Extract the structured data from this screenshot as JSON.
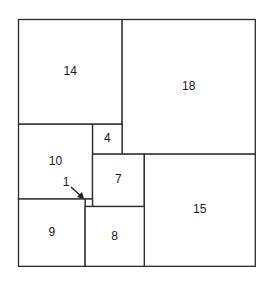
{
  "diagram": {
    "units": {
      "width": 32,
      "height": 33
    },
    "origin_px": {
      "x": 18.5,
      "y": 19.5
    },
    "scale_px": {
      "x": 7.4,
      "y": 7.48
    },
    "line_color": "#2a2a2a",
    "squares": [
      {
        "label": "14",
        "x": 0,
        "y": 0,
        "size": 14
      },
      {
        "label": "18",
        "x": 14,
        "y": 0,
        "size": 18
      },
      {
        "label": "4",
        "x": 10,
        "y": 14,
        "size": 4
      },
      {
        "label": "10",
        "x": 0,
        "y": 14,
        "size": 10
      },
      {
        "label": "7",
        "x": 10,
        "y": 18,
        "size": 7
      },
      {
        "label": "15",
        "x": 17,
        "y": 18,
        "size": 15
      },
      {
        "label": "1",
        "x": 9,
        "y": 24,
        "size": 1,
        "callout": true
      },
      {
        "label": "9",
        "x": 0,
        "y": 24,
        "size": 9
      },
      {
        "label": "8",
        "x": 9,
        "y": 25,
        "size": 8
      }
    ],
    "callout": {
      "label": "1",
      "text_px": {
        "x": 66,
        "y": 183
      },
      "arrow_from_px": {
        "x": 71,
        "y": 187
      },
      "arrow_to_px": {
        "x": 84,
        "y": 199
      }
    }
  }
}
